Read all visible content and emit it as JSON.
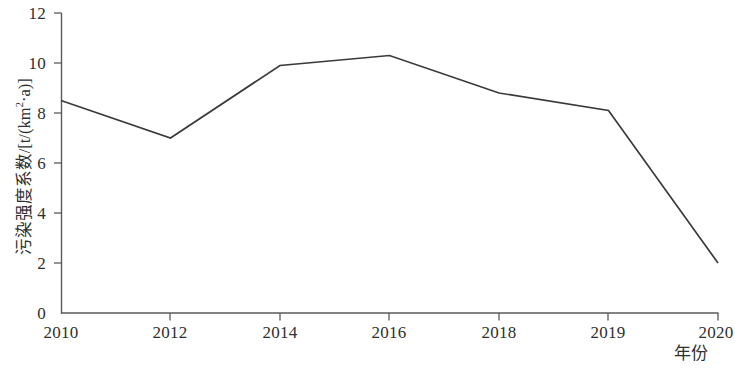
{
  "chart_data": {
    "type": "line",
    "title": "",
    "subtitle": "",
    "xlabel": "年份",
    "ylabel": "污染强度系数/[t/(km²·a)]",
    "categories": [
      "2010",
      "2012",
      "2014",
      "2016",
      "2018",
      "2019",
      "2020"
    ],
    "values": [
      8.5,
      7.0,
      9.9,
      10.3,
      8.8,
      8.1,
      2.0
    ],
    "series": [
      {
        "name": "污染强度系数",
        "values": [
          8.5,
          7.0,
          9.9,
          10.3,
          8.8,
          8.1,
          2.0
        ]
      }
    ],
    "ylim": [
      0,
      12
    ],
    "yticks": [
      0,
      2,
      4,
      6,
      8,
      10,
      12
    ],
    "ytick_labels": [
      "0",
      "2",
      "4",
      "6",
      "8",
      "10",
      "12"
    ],
    "xtick_labels": [
      "2010",
      "2012",
      "2014",
      "2016",
      "2018",
      "2019",
      "2020"
    ],
    "grid": false,
    "legend": false,
    "legend_position": "none",
    "markers": false,
    "line_color": "#3a3a3a",
    "axis_color": "#5a5a5a",
    "background_color": "#ffffff"
  },
  "axis": {
    "y_title_main": "污染强度系数/[t/(km",
    "y_title_sup": "2",
    "y_title_tail": "·a)]",
    "x_title": "年份"
  },
  "y_ticks": [
    {
      "label": "12",
      "value": 12
    },
    {
      "label": "10",
      "value": 10
    },
    {
      "label": "8",
      "value": 8
    },
    {
      "label": "6",
      "value": 6
    },
    {
      "label": "4",
      "value": 4
    },
    {
      "label": "2",
      "value": 2
    },
    {
      "label": "0",
      "value": 0
    }
  ],
  "x_ticks": [
    {
      "label": "2010"
    },
    {
      "label": "2012"
    },
    {
      "label": "2014"
    },
    {
      "label": "2016"
    },
    {
      "label": "2018"
    },
    {
      "label": "2019"
    },
    {
      "label": "2020"
    }
  ]
}
